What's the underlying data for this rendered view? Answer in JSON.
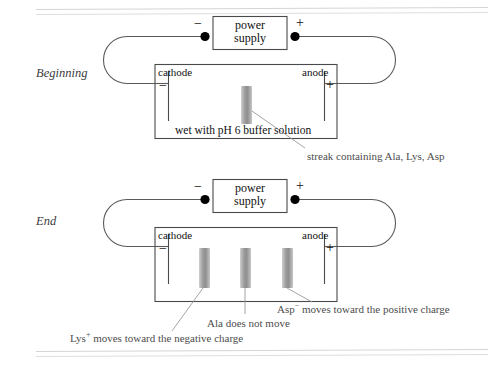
{
  "figure": {
    "title_hidden": "",
    "colors": {
      "ink": "#1a1a1a",
      "line": "#555555",
      "rule": "#d8d8d8",
      "band": "#a9a9a9",
      "annotation": "#4d4d4d",
      "terminal_dot": "#000000"
    }
  },
  "panels": [
    {
      "stage_label": "Beginning",
      "power_supply": {
        "line1": "power",
        "line2": "supply",
        "negative_sign": "−",
        "positive_sign": "+"
      },
      "chamber": {
        "cathode_label": "cathode",
        "cathode_sign": "−",
        "anode_label": "anode",
        "anode_sign": "+",
        "buffer_label": "wet with pH 6 buffer solution"
      },
      "bands": [
        {
          "name": "streak",
          "center_x_pct": 50,
          "label": "streak containing Ala, Lys, Asp"
        }
      ],
      "annotations": [
        {
          "text": "streak containing Ala, Lys, Asp"
        }
      ]
    },
    {
      "stage_label": "End",
      "power_supply": {
        "line1": "power",
        "line2": "supply",
        "negative_sign": "−",
        "positive_sign": "+"
      },
      "chamber": {
        "cathode_label": "cathode",
        "cathode_sign": "−",
        "anode_label": "anode",
        "anode_sign": "+",
        "buffer_label": ""
      },
      "bands": [
        {
          "name": "lys-band",
          "center_x_pct": 28
        },
        {
          "name": "ala-band",
          "center_x_pct": 50
        },
        {
          "name": "asp-band",
          "center_x_pct": 72
        }
      ],
      "annotations": [
        {
          "species": "Lys",
          "charge": "+",
          "text_before": "Lys",
          "text_after": " moves toward the negative charge"
        },
        {
          "species": "Ala",
          "charge": "",
          "text_before": "Ala does not move",
          "text_after": ""
        },
        {
          "species": "Asp",
          "charge": "−",
          "text_before": "Asp",
          "text_after": " moves toward the positive charge"
        }
      ]
    }
  ],
  "labels": {
    "beginning": "Beginning",
    "end": "End",
    "power_line1": "power",
    "power_line2": "supply",
    "minus": "−",
    "plus": "+",
    "cathode": "cathode",
    "anode": "anode",
    "buffer": "wet with pH 6 buffer solution",
    "streak_annotation": "streak containing Ala, Lys, Asp",
    "lys_prefix": "Lys",
    "lys_sup": "+",
    "lys_rest": " moves toward the negative charge",
    "ala_annotation": "Ala does not move",
    "asp_prefix": "Asp",
    "asp_sup": "−",
    "asp_rest": " moves toward the positive charge"
  }
}
